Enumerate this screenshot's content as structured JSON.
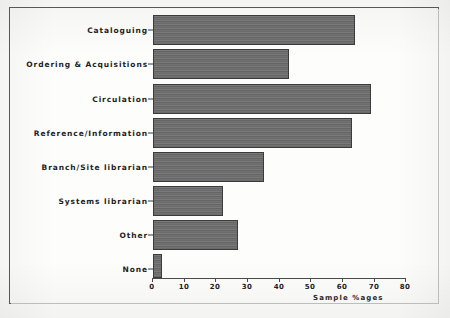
{
  "chart_data": {
    "type": "bar",
    "orientation": "horizontal",
    "title": "",
    "xlabel": "Sample %ages",
    "ylabel": "",
    "xlim": [
      0,
      80
    ],
    "xticks": [
      "0",
      "10",
      "20",
      "30",
      "40",
      "50",
      "60",
      "70",
      "80"
    ],
    "grid": false,
    "legend": null,
    "categories": [
      "Cataloguing",
      "Ordering & Acquisitions",
      "Circulation",
      "Reference/Information",
      "Branch/Site librarian",
      "Systems librarian",
      "Other",
      "None"
    ],
    "values": [
      64,
      43,
      69,
      63,
      35,
      22,
      27,
      3
    ],
    "series": [
      {
        "name": "Sample %ages",
        "values": [
          64,
          43,
          69,
          63,
          35,
          22,
          27,
          3
        ]
      }
    ],
    "colors": {
      "bar_fill": "#6d6d6d",
      "bar_edge": "#3b3b3b",
      "axis": "#4a4a4a",
      "text": "#1d1d1d",
      "frame": "#585858",
      "background": "#fdfdfb"
    }
  }
}
